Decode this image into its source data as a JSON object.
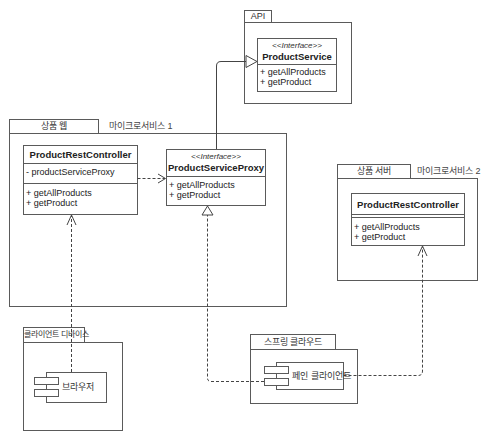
{
  "diagram": {
    "type": "UML deployment/class diagram",
    "packages": [
      {
        "id": "api",
        "tab_label": "API",
        "classes": [
          {
            "stereotype": "<<Interface>>",
            "name": "ProductService",
            "attributes": [],
            "operations": [
              "+ getAllProducts",
              "+ getProduct"
            ]
          }
        ]
      },
      {
        "id": "ms1",
        "tab_label": "상품 웹",
        "note": "마이크로서비스 1",
        "classes": [
          {
            "name": "ProductRestController",
            "attributes": [
              "- productServiceProxy"
            ],
            "operations": [
              "+ getAllProducts",
              "+ getProduct"
            ]
          },
          {
            "stereotype": "<<Interface>>",
            "name": "ProductServiceProxy",
            "attributes": [],
            "operations": [
              "+ getAllProducts",
              "+ getProduct"
            ]
          }
        ]
      },
      {
        "id": "ms2",
        "tab_label": "상품 서버",
        "note": "마이크로서비스 2",
        "classes": [
          {
            "name": "ProductRestController",
            "attributes": [],
            "operations": [
              "+ getAllProducts",
              "+ getProduct"
            ]
          }
        ]
      },
      {
        "id": "client",
        "tab_label": "클라이언트 디바이스",
        "components": [
          {
            "name": "브라우저"
          }
        ]
      },
      {
        "id": "cloud",
        "tab_label": "스프링 클라우드",
        "components": [
          {
            "name": "페인 클라이언트"
          }
        ]
      }
    ],
    "relationships": [
      {
        "from": "ProductServiceProxy",
        "to": "ProductService",
        "type": "generalization"
      },
      {
        "from": "ProductRestController (ms1)",
        "to": "ProductServiceProxy",
        "type": "dependency"
      },
      {
        "from": "브라우저",
        "to": "ProductRestController (ms1)",
        "type": "dependency"
      },
      {
        "from": "페인 클라이언트",
        "to": "ProductServiceProxy",
        "type": "realization"
      },
      {
        "from": "페인 클라이언트",
        "to": "ProductRestController (ms2)",
        "type": "dependency"
      }
    ],
    "colors": {
      "line": "#555555",
      "text": "#222222",
      "background": "#ffffff"
    }
  }
}
